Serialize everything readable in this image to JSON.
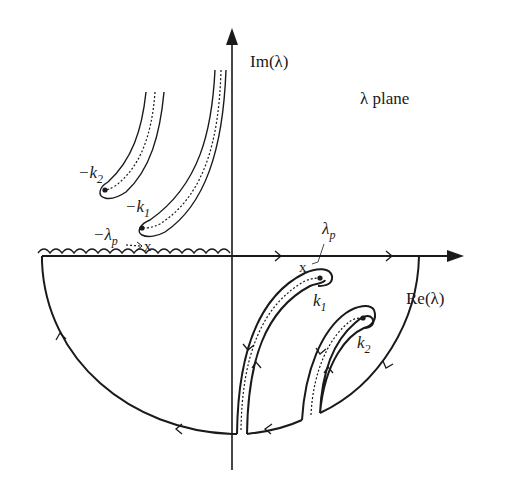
{
  "diagram": {
    "plane_label": "λ plane",
    "axes": {
      "imag_label": "Im(λ)",
      "real_label": "Re(λ)"
    },
    "points": {
      "neg_k2": "−k",
      "neg_k2_sub": "2",
      "neg_k1": "−k",
      "neg_k1_sub": "1",
      "neg_lambda_p": "−λ",
      "neg_lambda_p_sub": "p",
      "k1": "k",
      "k1_sub": "1",
      "k2": "k",
      "k2_sub": "2",
      "lambda_p": "λ",
      "lambda_p_sub": "p",
      "pole_marker": "x"
    },
    "colors": {
      "ink": "#1a1a1a",
      "background": "#ffffff"
    }
  }
}
